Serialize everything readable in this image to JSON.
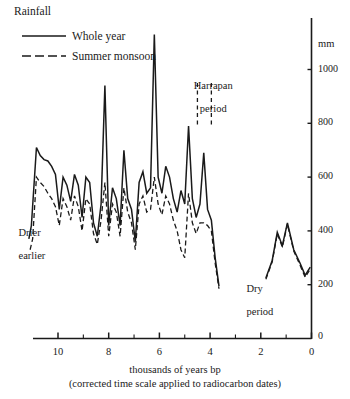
{
  "chart_data": {
    "type": "line",
    "title": "Rainfall",
    "xlabel": "thousands of years bp",
    "xlabel_sub": "(corrected time scale applied to radiocarbon dates)",
    "ylabel": "mm",
    "xlim": [
      11.6,
      -0.3
    ],
    "ylim": [
      0,
      1180
    ],
    "grid": false,
    "legend_position": "top-left",
    "y_ticks": [
      200,
      400,
      600,
      800,
      1000
    ],
    "y_tick_labels": [
      "200",
      "400",
      "600",
      "800",
      "1000"
    ],
    "y_axis_zero_label": "0",
    "x_ticks": [
      10,
      9,
      8,
      7,
      6,
      5,
      4,
      3,
      2,
      1,
      0
    ],
    "x_major_ticks": [
      10,
      8,
      6,
      4,
      2,
      0
    ],
    "x_tick_labels": [
      "10",
      "8",
      "6",
      "4",
      "2",
      "0"
    ],
    "legend": [
      {
        "name": "Whole year",
        "style": "solid"
      },
      {
        "name": "Summer monsoon",
        "style": "dashed"
      }
    ],
    "annotations": [
      {
        "text": "Harrapan\nperiod",
        "line1": "Harrapan",
        "line2": "period",
        "x": 5.05,
        "y": 1010
      },
      {
        "text": "Drier\nearlier",
        "line1": "Drier",
        "line2": "earlier",
        "x": 11.1,
        "y": 490
      },
      {
        "text": "Dry\nperiod",
        "line1": "Dry",
        "line2": "period",
        "x": 2.9,
        "y": 255
      }
    ],
    "marker_lines": [
      {
        "name": "harrapan-start",
        "x": 4.5,
        "y_from": 950,
        "y_to": 790,
        "style": "dashed"
      },
      {
        "name": "harrapan-end",
        "x": 3.95,
        "y_from": 950,
        "y_to": 790,
        "style": "dashed"
      }
    ],
    "series": [
      {
        "name": "Whole year",
        "style": "solid",
        "x": [
          11.15,
          11.05,
          10.85,
          10.7,
          10.55,
          10.4,
          10.25,
          10.1,
          9.95,
          9.8,
          9.65,
          9.5,
          9.35,
          9.2,
          9.05,
          8.9,
          8.75,
          8.6,
          8.45,
          8.3,
          8.15,
          8.0,
          7.85,
          7.7,
          7.55,
          7.4,
          7.25,
          7.1,
          6.95,
          6.8,
          6.65,
          6.5,
          6.35,
          6.2,
          6.05,
          5.9,
          5.75,
          5.6,
          5.45,
          5.3,
          5.15,
          5.0,
          4.85,
          4.7,
          4.55,
          4.4,
          4.25,
          4.1,
          3.95,
          3.8,
          3.65
        ],
        "y": [
          370,
          420,
          710,
          680,
          665,
          660,
          640,
          610,
          480,
          600,
          570,
          510,
          610,
          570,
          450,
          600,
          580,
          430,
          380,
          500,
          940,
          420,
          560,
          520,
          420,
          700,
          520,
          480,
          360,
          580,
          620,
          540,
          560,
          1130,
          600,
          540,
          640,
          600,
          520,
          470,
          550,
          500,
          790,
          520,
          450,
          500,
          690,
          480,
          440,
          300,
          195
        ]
      },
      {
        "name": "Whole year (late segment)",
        "style": "solid",
        "x": [
          1.8,
          1.55,
          1.35,
          1.15,
          0.95,
          0.7,
          0.45,
          0.25,
          0.05
        ],
        "y": [
          225,
          290,
          395,
          345,
          430,
          330,
          280,
          235,
          265
        ]
      },
      {
        "name": "Summer monsoon",
        "style": "dashed",
        "x": [
          11.1,
          11.0,
          10.85,
          10.7,
          10.55,
          10.4,
          10.25,
          10.1,
          9.95,
          9.8,
          9.65,
          9.5,
          9.35,
          9.2,
          9.05,
          8.9,
          8.75,
          8.6,
          8.45,
          8.3,
          8.15,
          8.0,
          7.85,
          7.7,
          7.55,
          7.4,
          7.25,
          7.1,
          6.95,
          6.8,
          6.65,
          6.5,
          6.35,
          6.2,
          6.05,
          5.9,
          5.75,
          5.6,
          5.45,
          5.3,
          5.15,
          5.0,
          4.85,
          4.7,
          4.55,
          4.4,
          4.25,
          4.1,
          3.95,
          3.8,
          3.65
        ],
        "y": [
          330,
          370,
          600,
          580,
          565,
          540,
          520,
          490,
          420,
          520,
          490,
          440,
          530,
          490,
          400,
          520,
          500,
          390,
          350,
          440,
          580,
          380,
          500,
          470,
          380,
          560,
          470,
          430,
          330,
          500,
          530,
          470,
          480,
          600,
          500,
          460,
          530,
          500,
          440,
          400,
          330,
          300,
          540,
          430,
          390,
          430,
          430,
          420,
          400,
          280,
          185
        ]
      },
      {
        "name": "Summer monsoon (late segment)",
        "style": "dashed",
        "x": [
          1.8,
          1.55,
          1.35,
          1.15,
          0.95,
          0.7,
          0.45,
          0.25,
          0.05
        ],
        "y": [
          220,
          285,
          390,
          340,
          425,
          325,
          272,
          228,
          258
        ]
      }
    ]
  },
  "legend_block": {
    "title": "Rainfall",
    "item1": "Whole year",
    "item2": "Summer monsoon"
  },
  "annotations_text": {
    "harrapan_line1": "Harrapan",
    "harrapan_line2": "period",
    "drier_line1": "Drier",
    "drier_line2": "earlier",
    "dry_line1": "Dry",
    "dry_line2": "period"
  },
  "axis_text": {
    "unit": "mm",
    "x_title": "thousands of years bp",
    "x_subtitle": "(corrected time scale applied to radiocarbon dates)",
    "y_zero": "0",
    "y_200": "200",
    "y_400": "400",
    "y_600": "600",
    "y_800": "800",
    "y_1000": "1000",
    "x_10": "10",
    "x_8": "8",
    "x_6": "6",
    "x_4": "4",
    "x_2": "2",
    "x_0": "0"
  }
}
